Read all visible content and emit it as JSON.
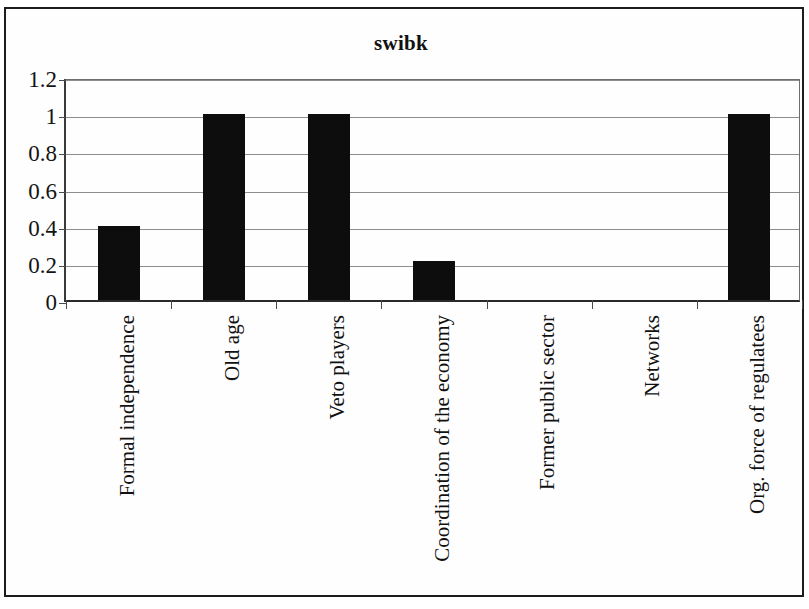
{
  "chart_data": {
    "type": "bar",
    "title": "swibk",
    "xlabel": "",
    "ylabel": "",
    "categories": [
      "Formal independence",
      "Old age",
      "Veto players",
      "Coordination of the economy",
      "Former public sector",
      "Networks",
      "Org. force of regulatees"
    ],
    "values": [
      0.4,
      1,
      1,
      0.21,
      0,
      0,
      1
    ],
    "ylim": [
      0,
      1.2
    ],
    "ytick_labels": [
      "0",
      "0.2",
      "0.4",
      "0.6",
      "0.8",
      "1",
      "1.2"
    ],
    "ytick_values": [
      0,
      0.2,
      0.4,
      0.6,
      0.8,
      1,
      1.2
    ],
    "grid": true,
    "legend": false,
    "bar_color": "#0d0d0d",
    "background_color": "#ffffff",
    "axis_color": "#2a2a2a",
    "gridline_color": "#8d8d8d"
  }
}
